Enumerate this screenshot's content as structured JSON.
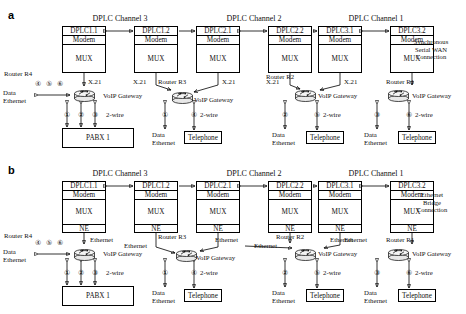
{
  "figure": {
    "panels": [
      {
        "key": "a",
        "letter": "a",
        "connection_note": "Synchronous\nSerial WAN\nConnection",
        "connection_note_lines": [
          "Synchronous",
          "Serial WAN",
          "Connection"
        ],
        "link_label": "X.21",
        "has_ne_row": false,
        "channels": [
          {
            "title": "DPLC Channel 3",
            "left_dplc": "DPLC1.1",
            "right_dplc": "DPLC1.2"
          },
          {
            "title": "DPLC Channel 2",
            "left_dplc": "DPLC2.1",
            "right_dplc": "DPLC2.2"
          },
          {
            "title": "DPLC Channel 1",
            "left_dplc": "DPLC3.1",
            "right_dplc": "DPLC3.2"
          }
        ],
        "routers": [
          {
            "name": "Router R4",
            "gateway_label": "VoIP Gateway",
            "left_circles": [
              "④",
              "⑤",
              "⑥"
            ],
            "left_label_lines": [
              "Data",
              "Ethernet"
            ],
            "bottom_circles": [
              "①",
              "②",
              "③"
            ],
            "twowire_label": "2-wire",
            "terminal": "PABX 1"
          },
          {
            "name": "Router R3",
            "gateway_label": "VoIP Gateway",
            "data_circle": "①",
            "phone_circle": "④",
            "data_label_lines": [
              "Data",
              "Ethernet"
            ],
            "twowire_label": "2-wire",
            "terminal": "Telephone"
          },
          {
            "name": "Router R2",
            "gateway_label": "VoIP Gateway",
            "data_circle": "②",
            "phone_circle": "⑤",
            "data_label_lines": [
              "Data",
              "Ethernet"
            ],
            "twowire_label": "2-wire",
            "terminal": "Telephone"
          },
          {
            "name": "Router R1",
            "gateway_label": "VoIP Gateway",
            "data_circle": "③",
            "phone_circle": "⑥",
            "data_label_lines": [
              "Data",
              "Ethernet"
            ],
            "twowire_label": "2-wire",
            "terminal": "Telephone"
          }
        ],
        "stack_rows": [
          "Modem",
          "MUX"
        ]
      },
      {
        "key": "b",
        "letter": "b",
        "connection_note": "Ethernet\nBridge\nConnection",
        "connection_note_lines": [
          "Ethernet",
          "Bridge",
          "Connection"
        ],
        "link_label": "Ethernet",
        "has_ne_row": true,
        "channels": [
          {
            "title": "DPLC Channel 3",
            "left_dplc": "DPLC1.1",
            "right_dplc": "DPLC1.2"
          },
          {
            "title": "DPLC Channel 2",
            "left_dplc": "DPLC2.1",
            "right_dplc": "DPLC2.2"
          },
          {
            "title": "DPLC Channel 1",
            "left_dplc": "DPLC3.1",
            "right_dplc": "DPLC3.2"
          }
        ],
        "routers": [
          {
            "name": "Router R4",
            "gateway_label": "VoIP Gateway",
            "left_circles": [
              "④",
              "⑤",
              "⑥"
            ],
            "left_label_lines": [
              "Data",
              "Ethernet"
            ],
            "bottom_circles": [
              "①",
              "②",
              "③"
            ],
            "twowire_label": "2-wire",
            "terminal": "PABX 1"
          },
          {
            "name": "Router R3",
            "gateway_label": "VoIP Gateway",
            "data_circle": "①",
            "phone_circle": "④",
            "data_label_lines": [
              "Data",
              "Ethernet"
            ],
            "twowire_label": "2-wire",
            "terminal": "Telephone"
          },
          {
            "name": "Router R2",
            "gateway_label": "VoIP Gateway",
            "data_circle": "②",
            "phone_circle": "⑤",
            "data_label_lines": [
              "Data",
              "Ethernet"
            ],
            "twowire_label": "2-wire",
            "terminal": "Telephone"
          },
          {
            "name": "Router R1",
            "gateway_label": "VoIP Gateway",
            "data_circle": "③",
            "phone_circle": "⑥",
            "data_label_lines": [
              "Data",
              "Ethernet"
            ],
            "twowire_label": "2-wire",
            "terminal": "Telephone"
          }
        ],
        "stack_rows": [
          "Modem",
          "MUX",
          "NE"
        ]
      }
    ],
    "common": {
      "row_modem": "Modem",
      "row_mux": "MUX",
      "row_ne": "NE",
      "gateway_label": "VoIP Gateway",
      "twowire": "2-wire",
      "pabx": "PABX 1",
      "telephone": "Telephone",
      "data": "Data",
      "ethernet": "Ethernet",
      "x21": "X.21"
    }
  }
}
